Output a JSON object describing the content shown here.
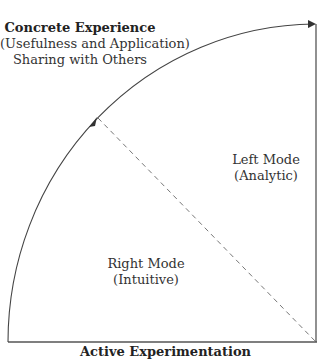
{
  "diagram": {
    "top_label": {
      "title": "Concrete Experience",
      "line2": "(Usefulness and Application)",
      "line3": "Sharing with Others"
    },
    "bottom_label": "Active Experimentation",
    "left_region": {
      "title": "Right Mode",
      "subtitle": "(Intuitive)"
    },
    "right_region": {
      "title": "Left Mode",
      "subtitle": "(Analytic)"
    },
    "colors": {
      "line": "#555555",
      "dashed": "#777777",
      "text": "#333333"
    }
  }
}
